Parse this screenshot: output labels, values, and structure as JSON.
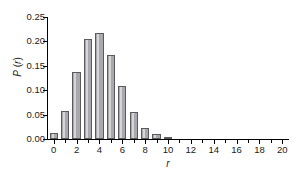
{
  "chart_data": {
    "type": "bar",
    "title": "",
    "xlabel": "r",
    "ylabel": "P (r)",
    "categories": [
      0,
      1,
      2,
      3,
      4,
      5,
      6,
      7,
      8,
      9,
      10,
      11,
      12,
      13,
      14,
      15,
      16,
      17,
      18,
      19,
      20
    ],
    "values": [
      0.012,
      0.058,
      0.138,
      0.204,
      0.218,
      0.172,
      0.108,
      0.055,
      0.022,
      0.01,
      0.003,
      0,
      0,
      0,
      0,
      0,
      0,
      0,
      0,
      0,
      0
    ],
    "xlim": [
      -0.5,
      20.5
    ],
    "ylim": [
      0.0,
      0.25
    ],
    "xticks": [
      0,
      1,
      2,
      3,
      4,
      5,
      6,
      7,
      8,
      9,
      10,
      11,
      12,
      13,
      14,
      15,
      16,
      17,
      18,
      19,
      20
    ],
    "xtick_labels": [
      "0",
      "",
      "2",
      "",
      "4",
      "",
      "6",
      "",
      "8",
      "",
      "10",
      "",
      "12",
      "",
      "14",
      "",
      "16",
      "",
      "18",
      "",
      "20"
    ],
    "yticks": [
      0.0,
      0.05,
      0.1,
      0.15,
      0.2,
      0.25
    ],
    "ytick_labels": [
      "0.00",
      "0.05",
      "0.10",
      "0.15",
      "0.20",
      "0.25"
    ],
    "grid": false,
    "legend": null,
    "bar_fill_color": "#a9a9ad",
    "bar_edge_color": "#5a5a5e",
    "background_color": "#ffffff",
    "axis_color": "#000000"
  }
}
